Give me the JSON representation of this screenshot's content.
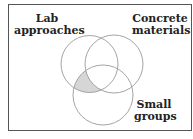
{
  "diagram": {
    "type": "venn",
    "sets": [
      {
        "label_line1": "Lab",
        "label_line2": "approaches"
      },
      {
        "label_line1": "Concrete",
        "label_line2": "materials"
      },
      {
        "label_line1": "Small",
        "label_line2": "groups"
      }
    ],
    "shaded_region": "Lab approaches ∩ Small groups, excluding Concrete materials",
    "colors": {
      "stroke": "#9a9a9a",
      "shade": "#d6d6d6",
      "frame": "#555555"
    }
  }
}
